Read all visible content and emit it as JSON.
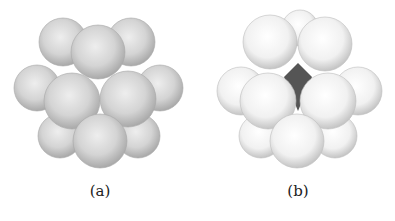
{
  "figure": {
    "panels": [
      {
        "id": "a",
        "label": "(a)",
        "label_x": 100,
        "label_y": 182,
        "sphere_color": "#d9d9d9",
        "sphere_edge": "#a8a8a8",
        "center_atom": false,
        "spheres": [
          {
            "cx": 63,
            "cy": 42,
            "r": 24
          },
          {
            "cx": 131,
            "cy": 42,
            "r": 24
          },
          {
            "cx": 37,
            "cy": 88,
            "r": 23
          },
          {
            "cx": 160,
            "cy": 88,
            "r": 23
          },
          {
            "cx": 60,
            "cy": 136,
            "r": 22
          },
          {
            "cx": 138,
            "cy": 136,
            "r": 22
          },
          {
            "cx": 98,
            "cy": 52,
            "r": 27
          },
          {
            "cx": 72,
            "cy": 101,
            "r": 28
          },
          {
            "cx": 128,
            "cy": 99,
            "r": 28
          },
          {
            "cx": 100,
            "cy": 141,
            "r": 27
          }
        ]
      },
      {
        "id": "b",
        "label": "(b)",
        "label_x": 298,
        "label_y": 182,
        "sphere_color": "#f4f4f4",
        "sphere_edge": "#bdbdbd",
        "center_atom": true,
        "center_color": "#555555",
        "center": {
          "cx": 298,
          "cy": 77,
          "r": 14
        },
        "spheres": [
          {
            "cx": 300,
            "cy": 28,
            "r": 18
          },
          {
            "cx": 241,
            "cy": 91,
            "r": 24
          },
          {
            "cx": 358,
            "cy": 91,
            "r": 24
          },
          {
            "cx": 261,
            "cy": 136,
            "r": 22
          },
          {
            "cx": 335,
            "cy": 136,
            "r": 22
          },
          {
            "cx": 270,
            "cy": 42,
            "r": 27
          },
          {
            "cx": 325,
            "cy": 44,
            "r": 27
          },
          {
            "cx": 268,
            "cy": 101,
            "r": 28
          },
          {
            "cx": 328,
            "cy": 101,
            "r": 28
          },
          {
            "cx": 297,
            "cy": 141,
            "r": 27
          }
        ]
      }
    ]
  }
}
